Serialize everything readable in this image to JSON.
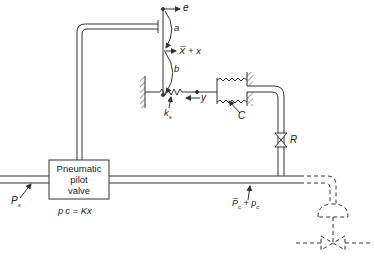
{
  "diagram": {
    "type": "pneumatic flapper-nozzle control schematic",
    "pilot_valve": {
      "lines": [
        "Pneumatic",
        "pilot",
        "valve"
      ],
      "equation": "p c = Kx"
    },
    "labels": {
      "supply_pressure": "P",
      "supply_pressure_sub": "s",
      "output_pressure": "P̅",
      "output_pressure_sub": "c",
      "output_pressure_tail": " + p",
      "output_pressure_tail_sub": "c",
      "error_input": "e",
      "flapper_motion": "X̅ + x",
      "lever_upper": "a",
      "lever_lower": "b",
      "feedback_displacement": "y",
      "spring_constant": "k",
      "spring_constant_sub": "s",
      "bellows_capacitance": "C",
      "restriction": "R"
    },
    "colors": {
      "line": "#333333",
      "background": "#ffffff"
    }
  }
}
